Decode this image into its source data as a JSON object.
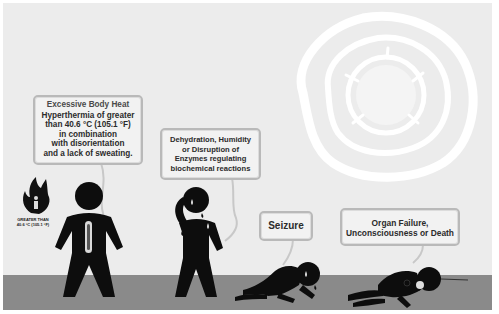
{
  "figure": {
    "theme": "Heat stroke progression",
    "colors": {
      "background": "#ececec",
      "ground": "#8a8a8a",
      "figure": "#0d0d0d",
      "bubble_fill": "#f2f2f2",
      "bubble_border": "#b9b9b9",
      "sun": "#ffffff"
    }
  },
  "stages": [
    {
      "heading": "Excessive Body Heat",
      "lines": [
        "Hyperthermia of greater",
        "than 40.6 °C (105.1 °F)",
        "in combination",
        "with disorientation",
        "and a lack of sweating."
      ]
    },
    {
      "lines": [
        "Dehydration, Humidity",
        "or Disruption of",
        "Enzymes regulating",
        "biochemical reactions"
      ]
    },
    {
      "lines": [
        "Seizure"
      ]
    },
    {
      "lines": [
        "Organ Failure,",
        "Unconsciousness or Death"
      ]
    }
  ],
  "temperature_icon": {
    "icon": "flame-person-icon",
    "label_lines": [
      "GREATER THAN",
      "40.6 °C (105.1 °F)"
    ]
  }
}
